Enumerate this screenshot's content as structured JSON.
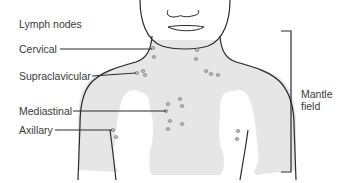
{
  "diagram": {
    "heading": "Lymph nodes",
    "labels": {
      "cervical": "Cervical",
      "supraclavicular": "Supraclavicular",
      "mediastinal": "Mediastinal",
      "axillary": "Axillary"
    },
    "bracket_label_line1": "Mantle",
    "bracket_label_line2": "field",
    "colors": {
      "outline": "#2a2a2a",
      "field_fill": "#e6e6e6",
      "node_fill": "#b9b9b9",
      "node_stroke": "#8a8a8a",
      "text": "#3a3a3a"
    }
  }
}
